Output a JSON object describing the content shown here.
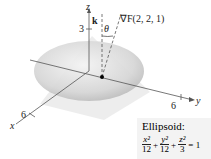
{
  "figure": {
    "axes": {
      "z_label": "z",
      "y_label": "y",
      "x_label": "x",
      "z_tick": "3",
      "y_tick": "6",
      "x_tick": "6"
    },
    "vectors": {
      "k_label": "k",
      "theta_label": "θ",
      "gradient_label": "∇F(2, 2, 1)"
    },
    "caption": {
      "title": "Ellipsoid:",
      "equation": {
        "t1_num": "x²",
        "t1_den": "12",
        "plus1": "+",
        "t2_num": "y²",
        "t2_den": "12",
        "plus2": "+",
        "t3_num": "z²",
        "t3_den": "3",
        "rhs": "= 1"
      }
    },
    "colors": {
      "ellipsoid_fill": "#d9d9d9",
      "plane_fill": "#ececec",
      "axis": "#555555",
      "point": "#000000"
    }
  }
}
